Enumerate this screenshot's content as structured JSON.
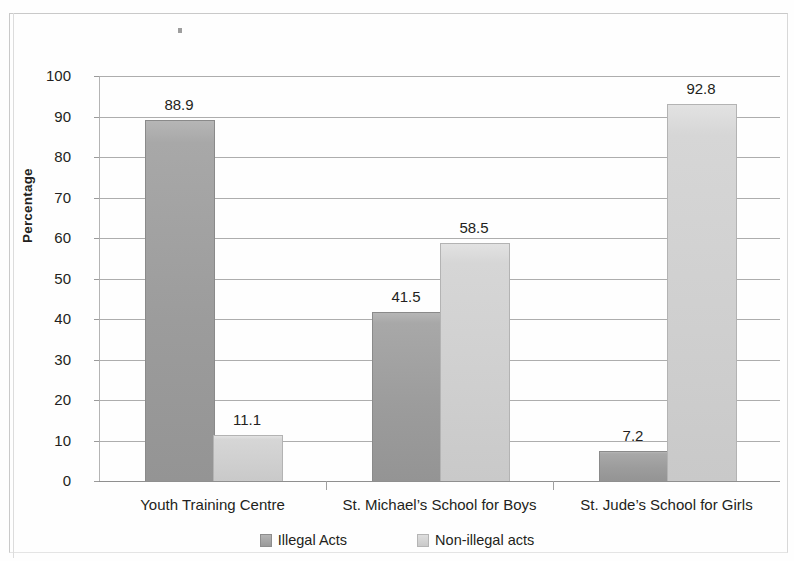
{
  "chart_data": {
    "type": "bar",
    "title": "",
    "xlabel": "",
    "ylabel": "Percentage",
    "ylim": [
      0,
      100
    ],
    "ytick_step": 10,
    "yticks": [
      "100",
      "90",
      "80",
      "70",
      "60",
      "50",
      "40",
      "30",
      "20",
      "10",
      "0"
    ],
    "grid": true,
    "legend_position": "bottom",
    "categories": [
      "Youth Training Centre",
      "St. Michael’s School for Boys",
      "St. Jude’s School for Girls"
    ],
    "series": [
      {
        "name": "Illegal Acts",
        "color": "#9c9c9c",
        "values": [
          88.9,
          41.5,
          7.2
        ],
        "labels": [
          "88.9",
          "41.5",
          "7.2"
        ]
      },
      {
        "name": "Non-illegal acts",
        "color": "#cfcfcf",
        "values": [
          11.1,
          58.5,
          92.8
        ],
        "labels": [
          "11.1",
          "58.5",
          "92.8"
        ]
      }
    ]
  },
  "axis": {
    "y_title": "Percentage"
  },
  "legend": {
    "items": [
      {
        "label": "Illegal Acts",
        "swatch": "dark"
      },
      {
        "label": "Non-illegal acts",
        "swatch": "light"
      }
    ]
  }
}
